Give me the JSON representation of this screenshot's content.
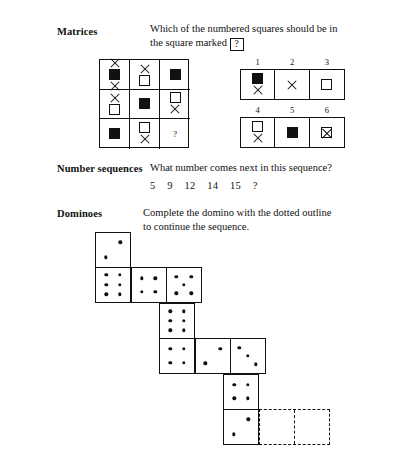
{
  "page": {
    "background": "#ffffff",
    "ink": "#111111"
  },
  "sections": {
    "matrices": {
      "label": "Matrices",
      "prompt_line_1": "Which of the numbered squares should be in",
      "prompt_line_2_before": "the square marked",
      "prompt_qbox": "?",
      "grid": {
        "rows": 3,
        "cols": 3,
        "cells": [
          {
            "id": "r1c1",
            "shapes": [
              "x-mark",
              "filled-square",
              "x-mark"
            ]
          },
          {
            "id": "r1c2",
            "shapes": [
              "x-mark",
              "open-square"
            ]
          },
          {
            "id": "r1c3",
            "shapes": [
              "filled-square"
            ]
          },
          {
            "id": "r2c1",
            "shapes": [
              "x-mark",
              "open-square"
            ]
          },
          {
            "id": "r2c2",
            "shapes": [
              "filled-square"
            ]
          },
          {
            "id": "r2c3",
            "shapes": [
              "open-square",
              "x-mark"
            ]
          },
          {
            "id": "r3c1",
            "shapes": [
              "filled-square"
            ]
          },
          {
            "id": "r3c2",
            "shapes": [
              "open-square",
              "x-mark"
            ]
          },
          {
            "id": "r3c3",
            "shapes": [
              "question-mark"
            ],
            "label": "?"
          }
        ]
      },
      "options": [
        {
          "number": "1",
          "shapes": [
            "filled-square",
            "x-mark"
          ]
        },
        {
          "number": "2",
          "shapes": [
            "x-mark"
          ]
        },
        {
          "number": "3",
          "shapes": [
            "open-square"
          ]
        },
        {
          "number": "4",
          "shapes": [
            "open-square",
            "x-mark"
          ]
        },
        {
          "number": "5",
          "shapes": [
            "filled-square"
          ]
        },
        {
          "number": "6",
          "shapes": [
            "crossed-square"
          ]
        }
      ]
    },
    "number_sequences": {
      "label": "Number sequences",
      "prompt": "What number comes next in this sequence?",
      "sequence": [
        "5",
        "9",
        "12",
        "14",
        "15",
        "?"
      ]
    },
    "dominoes": {
      "label": "Dominoes",
      "prompt_line_1": "Complete the domino with the dotted outline",
      "prompt_line_2": "to continue the sequence.",
      "tiles": [
        {
          "id": "domino-1",
          "orientation": "vertical",
          "values": [
            2,
            6
          ],
          "dashed": false
        },
        {
          "id": "domino-2",
          "orientation": "horizontal",
          "values": [
            4,
            5
          ],
          "dashed": false
        },
        {
          "id": "domino-3",
          "orientation": "vertical",
          "values": [
            6,
            4
          ],
          "dashed": false
        },
        {
          "id": "domino-4",
          "orientation": "horizontal",
          "values": [
            2,
            3
          ],
          "dashed": false
        },
        {
          "id": "domino-5",
          "orientation": "vertical",
          "values": [
            4,
            2
          ],
          "dashed": false
        },
        {
          "id": "domino-6",
          "orientation": "horizontal",
          "values": [
            0,
            0
          ],
          "dashed": true
        }
      ]
    }
  }
}
